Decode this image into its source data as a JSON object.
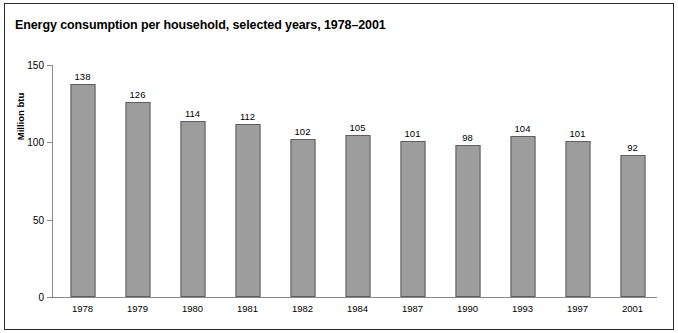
{
  "figure": {
    "title": "Energy consumption per household, selected years, 1978–2001",
    "frame_color": "#2b2b2b",
    "background": "#ffffff"
  },
  "chart_data": {
    "type": "bar",
    "title": "Energy consumption per household, selected years, 1978–2001",
    "xlabel": "",
    "ylabel": "Million btu",
    "categories": [
      "1978",
      "1979",
      "1980",
      "1981",
      "1982",
      "1984",
      "1987",
      "1990",
      "1993",
      "1997",
      "2001"
    ],
    "values": [
      138,
      126,
      114,
      112,
      102,
      105,
      101,
      98,
      104,
      101,
      92
    ],
    "ylim": [
      0,
      150
    ],
    "yticks": [
      0,
      50,
      100,
      150
    ],
    "ytick_labels": [
      "0",
      "50",
      "100",
      "150"
    ],
    "grid": false,
    "legend": null,
    "bar_color": "#9d9d9d",
    "bar_border_color": "#5e5e5e",
    "axis_color": "#8a8a8a",
    "data_labels": [
      "138",
      "126",
      "114",
      "112",
      "102",
      "105",
      "101",
      "98",
      "104",
      "101",
      "92"
    ]
  }
}
